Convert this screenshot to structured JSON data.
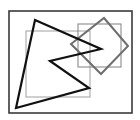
{
  "diagram": {
    "width": 140,
    "height": 120,
    "background": "#ffffff",
    "shapes": [
      {
        "id": "outer-frame",
        "type": "rect",
        "x": 9,
        "y": 11,
        "w": 123,
        "h": 102,
        "stroke": "#3a3a3a",
        "stroke_width": 1.6
      },
      {
        "id": "large-gray-rect",
        "type": "rect",
        "x": 26,
        "y": 31,
        "w": 64,
        "h": 66,
        "stroke": "#a8a8a8",
        "stroke_width": 1.1
      },
      {
        "id": "small-gray-rect",
        "type": "rect",
        "x": 78,
        "y": 24,
        "w": 43,
        "h": 43,
        "stroke": "#8a8a8a",
        "stroke_width": 1.1
      },
      {
        "id": "rotated-square",
        "type": "polygon",
        "points": "104,18 128,46 101,74 71,44",
        "stroke": "#6e6e6e",
        "stroke_width": 2
      },
      {
        "id": "black-zigzag-polygon",
        "type": "polygon",
        "points": "35,20 101,49 50,61 89,88 16,108",
        "stroke": "#111111",
        "stroke_width": 2.2
      }
    ]
  }
}
